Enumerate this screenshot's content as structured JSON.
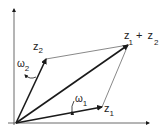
{
  "diagram": {
    "title": "",
    "labels": {
      "z1": "z",
      "z1_sub": "1",
      "z2": "z",
      "z2_sub": "2",
      "sum_a": "z",
      "sum_a_sub": "1",
      "sum_plus": "+",
      "sum_b": "z",
      "sum_b_sub": "2",
      "omega1": "ω",
      "omega1_sub": "1",
      "omega2": "ω",
      "omega2_sub": "2"
    },
    "colors": {
      "stroke": "#1a1a1a",
      "thin": "#555555"
    }
  }
}
